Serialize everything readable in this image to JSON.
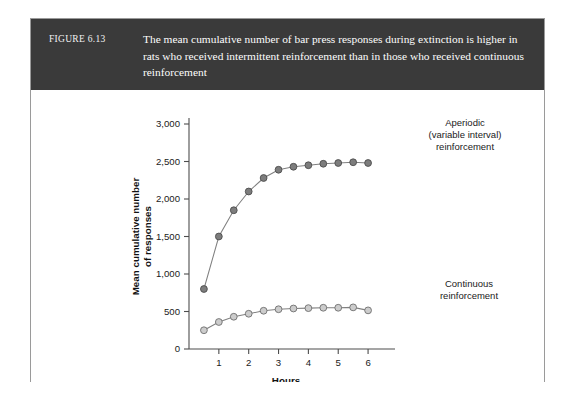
{
  "figure": {
    "number": "FIGURE 6.13",
    "caption": "The mean cumulative number of bar press responses during extinction is higher in rats who received intermittent reinforcement than in those who received continuous reinforcement",
    "caption_lines": [
      "The mean cumulative number of bar press responses during extinction is higher",
      "in rats who received intermittent reinforcement than in those who received",
      "continuous reinforcement"
    ],
    "header_background": "#3a3a3a",
    "header_text_color": "#ffffff",
    "border_color": "#9a9a9a"
  },
  "annotations": {
    "aperiodic": {
      "lines": [
        "Aperiodic",
        "(variable interval)",
        "reinforcement"
      ]
    },
    "continuous": {
      "lines": [
        "Continuous",
        "reinforcement"
      ]
    }
  },
  "chart_data": {
    "type": "line",
    "title": "",
    "xlabel": "Hours",
    "ylabel": "Mean cumulative number of responses",
    "ylabel_lines": [
      "Mean cumulative number",
      "of responses"
    ],
    "xlim": [
      0,
      6.5
    ],
    "ylim": [
      0,
      3000
    ],
    "xticks": [
      1,
      2,
      3,
      4,
      5,
      6
    ],
    "xtick_labels": [
      "1",
      "2",
      "3",
      "4",
      "5",
      "6"
    ],
    "yticks": [
      0,
      500,
      1000,
      1500,
      2000,
      2500,
      3000
    ],
    "ytick_labels": [
      "0",
      "500",
      "1,000",
      "1,500",
      "2,000",
      "2,500",
      "3,000"
    ],
    "grid": false,
    "legend_position": "inline-annotation",
    "x": [
      0.5,
      1.0,
      1.5,
      2.0,
      2.5,
      3.0,
      3.5,
      4.0,
      4.5,
      5.0,
      5.5,
      6.0
    ],
    "series": [
      {
        "name": "Aperiodic (variable interval) reinforcement",
        "marker_fill": "#7d7d7d",
        "marker_stroke": "#4d4d4d",
        "line_color": "#808080",
        "values": [
          800,
          1500,
          1850,
          2100,
          2280,
          2390,
          2430,
          2450,
          2470,
          2480,
          2490,
          2480
        ]
      },
      {
        "name": "Continuous reinforcement",
        "marker_fill": "#cccccc",
        "marker_stroke": "#6f6f6f",
        "line_color": "#808080",
        "values": [
          250,
          360,
          430,
          470,
          510,
          530,
          540,
          545,
          550,
          550,
          555,
          515
        ]
      }
    ]
  }
}
